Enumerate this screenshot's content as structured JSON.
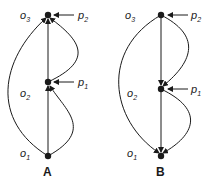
{
  "diagrams": [
    {
      "caption": "A",
      "labels": {
        "o3": "o",
        "o3_sub": "3",
        "o2": "o",
        "o2_sub": "2",
        "o1": "o",
        "o1_sub": "1",
        "p2": "p",
        "p2_sub": "2",
        "p1": "p",
        "p1_sub": "1"
      }
    },
    {
      "caption": "B",
      "labels": {
        "o3": "o",
        "o3_sub": "3",
        "o2": "o",
        "o2_sub": "2",
        "o1": "o",
        "o1_sub": "1",
        "p2": "p",
        "p2_sub": "2",
        "p1": "p",
        "p1_sub": "1"
      }
    }
  ],
  "colors": {
    "ink": "#1a1a1a"
  }
}
